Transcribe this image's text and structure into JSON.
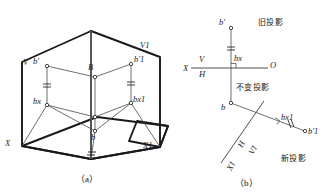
{
  "figure": {
    "title_caption_a": "（a）",
    "title_caption_b": "（b）",
    "stroke_color": "#1a1a1a",
    "thin_color": "#555555",
    "panel_a": {
      "name": "pictorial-two-plane-change-diagram",
      "labels": {
        "plane_v": "V",
        "plane_v1": "V1",
        "axis_x": "X",
        "axis_x1": "X1",
        "point_b_front": "b'",
        "point_b_front1": "b'1",
        "point_B": "B",
        "point_b_horizontal": "b",
        "point_bx": "bx",
        "point_bx1": "bx1"
      }
    },
    "panel_b": {
      "name": "orthographic-change-of-plane-diagram",
      "labels": {
        "axis_x": "X",
        "plane_v": "V",
        "plane_h": "H",
        "origin": "O",
        "point_b_front": "b'",
        "point_bx": "bx",
        "point_b_horizontal": "b",
        "point_bx1": "bx1",
        "point_b_front1": "b'1",
        "new_axis_h": "H",
        "new_axis_v1": "V1",
        "new_axis_x1": "X1",
        "note_old_projection": "旧投影",
        "note_unchanged_projection": "不变投影",
        "note_new_projection": "新投影"
      }
    }
  }
}
